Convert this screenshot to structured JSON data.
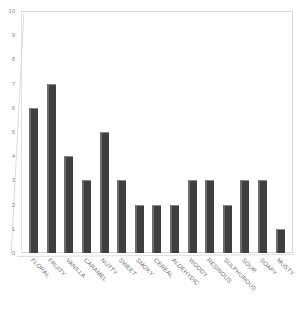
{
  "chart_data": {
    "type": "bar",
    "title": "",
    "xlabel": "",
    "ylabel": "",
    "ylim": [
      0,
      10
    ],
    "yticks": [
      10,
      9,
      8,
      7,
      6,
      5,
      4,
      3,
      2,
      1,
      0
    ],
    "grid": false,
    "legend": null,
    "bar_color": "#3f3f3f",
    "categories": [
      "FLORAL",
      "FRUITY",
      "VANILLA",
      "CARAMEL",
      "NUTTY",
      "SWEET",
      "SMOKY",
      "CEREAL",
      "ALDEHYDIC",
      "WOODY",
      "RESINOUS",
      "SULPHUROUS",
      "SOUR",
      "SOAPY",
      "MUSTY"
    ],
    "values": [
      6,
      7,
      4,
      3,
      5,
      3,
      2,
      2,
      2,
      3,
      3,
      2,
      3,
      3,
      1
    ]
  }
}
